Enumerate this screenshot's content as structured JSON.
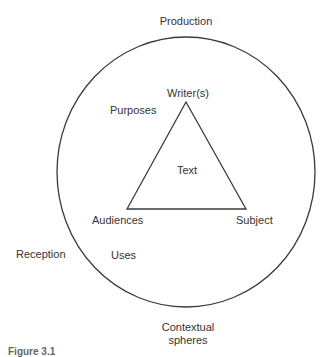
{
  "diagram": {
    "outer_circle": {
      "cx": 186,
      "cy": 172,
      "rx": 129,
      "ry": 135,
      "stroke": "#3a3a3a"
    },
    "triangle": {
      "points": "186,102 127,209 246,209",
      "stroke": "#3a3a3a"
    },
    "labels": {
      "production": "Production",
      "writers": "Writer(s)",
      "purposes": "Purposes",
      "text": "Text",
      "audiences": "Audiences",
      "subject": "Subject",
      "reception": "Reception",
      "uses": "Uses",
      "contextual_line1": "Contextual",
      "contextual_line2": "spheres"
    }
  },
  "caption": {
    "label": "Figure 3.1"
  }
}
